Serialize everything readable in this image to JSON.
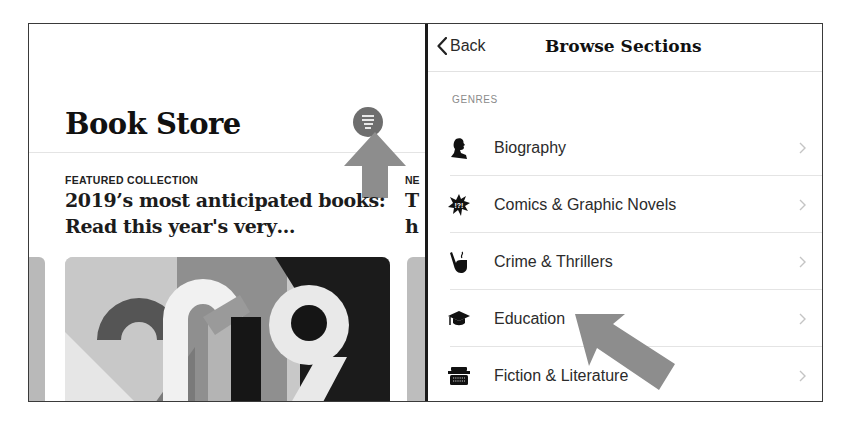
{
  "left_pane": {
    "title": "Book Store",
    "menu_button": "menu-icon",
    "featured": {
      "kicker": "FEATURED COLLECTION",
      "headline": "2019’s most anticipated books: Read this year's very…",
      "artwork_label": "2019"
    },
    "next_card": {
      "kicker": "NE",
      "headline_line1": "T",
      "headline_line2": "h"
    }
  },
  "right_pane": {
    "navbar": {
      "back_label": "Back",
      "title": "Browse Sections"
    },
    "section_header": "GENRES",
    "genres": [
      {
        "label": "Biography",
        "icon": "biography-silhouette-icon"
      },
      {
        "label": "Comics & Graphic Novels",
        "icon": "comics-burst-icon"
      },
      {
        "label": "Crime & Thrillers",
        "icon": "pipe-icon"
      },
      {
        "label": "Education",
        "icon": "graduation-cap-icon"
      },
      {
        "label": "Fiction & Literature",
        "icon": "typewriter-icon"
      }
    ]
  },
  "annotations": {
    "arrow_color": "#8a8a8a",
    "arrow_1_target": "menu-button",
    "arrow_2_target": "genre-education"
  }
}
